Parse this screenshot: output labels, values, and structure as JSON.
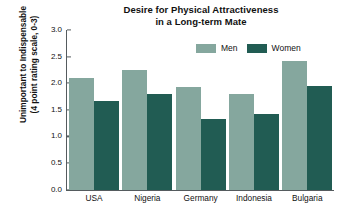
{
  "chart_data": {
    "type": "bar",
    "title": "Desire for Physical Attractiveness in a Long-term Mate",
    "title_lines": [
      "Desire for Physical Attractiveness",
      "in a Long-term Mate"
    ],
    "xlabel": "",
    "ylabel": "Unimportant to Indispensable (4 point rating scale, 0-3)",
    "ylabel_lines": [
      "Unimportant to Indispensable",
      "(4 point rating scale, 0-3)"
    ],
    "categories": [
      "USA",
      "Nigeria",
      "Germany",
      "Indonesia",
      "Bulgaria"
    ],
    "series": [
      {
        "name": "Men",
        "color": "#85a79e",
        "values": [
          2.1,
          2.25,
          1.92,
          1.8,
          2.42
        ]
      },
      {
        "name": "Women",
        "color": "#215c53",
        "values": [
          1.66,
          1.8,
          1.32,
          1.42,
          1.95
        ]
      }
    ],
    "ylim": [
      0,
      3
    ],
    "yticks": [
      "0.0",
      "0.5",
      "1.0",
      "1.5",
      "2.0",
      "2.5",
      "3.0"
    ],
    "ytick_values": [
      0,
      0.5,
      1.0,
      1.5,
      2.0,
      2.5,
      3.0
    ],
    "grid": false,
    "legend_position": "top-right"
  },
  "legend": {
    "entries": [
      {
        "label": "Men"
      },
      {
        "label": "Women"
      }
    ]
  }
}
